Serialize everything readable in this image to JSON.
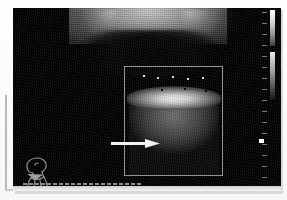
{
  "modality": {
    "type": "ultrasound-b-mode",
    "study_region": "thyroid-neck",
    "view_label": ""
  },
  "scan": {
    "background_color": "#000000",
    "frame_border_color": "#d8d8d8",
    "width_px": 268,
    "height_px": 183
  },
  "roi": {
    "label": "",
    "border_color": "#9a9a9a",
    "x": 111,
    "y": 58,
    "width": 99,
    "height": 110
  },
  "annotations": {
    "arrow": {
      "icon": "arrow-right-icon",
      "color": "#ffffff",
      "tip_x": 147,
      "tip_y": 131,
      "tail_x": 98,
      "tail_y": 131,
      "label": ""
    },
    "body_marker": {
      "icon": "head-neck-body-marker-icon",
      "color": "#9a9a9a",
      "label": ""
    }
  },
  "grayscale_bar": {
    "name": "grayscale-wedge",
    "top_color": "#ffffff",
    "bottom_color": "#141414",
    "segments": 2
  },
  "depth_scale": {
    "name": "depth-tick-column",
    "tick_color": "#7a7a7a",
    "tick_count": 16,
    "focus_marker_color": "#ffffff"
  },
  "tgc": {
    "name": "tgc-dash-strip",
    "dash_color": "#8c8c8c",
    "dash_count": 22
  },
  "left_caliper": {
    "name": "left-rule",
    "color": "#b9b9b9"
  }
}
